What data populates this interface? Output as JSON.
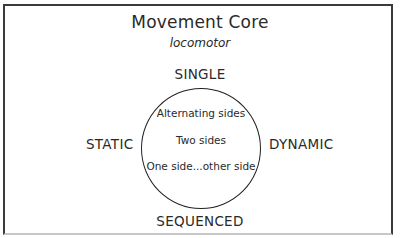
{
  "diagram": {
    "title": "Movement Core",
    "subtitle": "locomotor",
    "axes": {
      "top": "SINGLE",
      "bottom": "SEQUENCED",
      "left": "STATIC",
      "right": "DYNAMIC"
    },
    "circle_items": [
      "Alternating sides",
      "Two sides",
      "One side...other side"
    ],
    "colors": {
      "line": "#222222",
      "text": "#2a2a2a",
      "frame": "#3a3a3a",
      "frame_bottom": "#c8c8c8",
      "background": "#ffffff"
    }
  }
}
